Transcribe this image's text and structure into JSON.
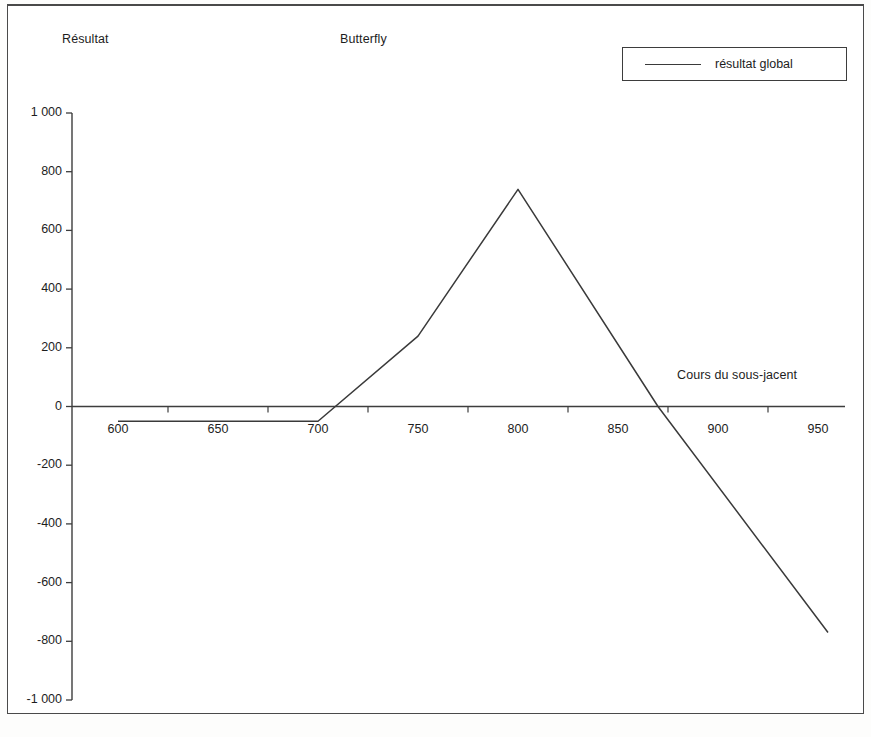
{
  "figure": {
    "y_axis_title": "Résultat",
    "title": "Butterfly",
    "x_axis_title": "Cours du sous-jacent",
    "legend_label": "résultat global",
    "line_color": "#3a3a3a",
    "axis_color": "#3d3d3d",
    "background": "#ffffff"
  },
  "chart_data": {
    "type": "line",
    "title": "Butterfly",
    "xlabel": "Cours du sous-jacent",
    "ylabel": "Résultat",
    "xlim": [
      590,
      960
    ],
    "ylim": [
      -1000,
      1000
    ],
    "grid": false,
    "legend_position": "top-right",
    "x_ticks": [
      600,
      650,
      700,
      750,
      800,
      850,
      900,
      950
    ],
    "x_tick_labels": [
      "600",
      "650",
      "700",
      "750",
      "800",
      "850",
      "900",
      "950"
    ],
    "y_ticks": [
      1000,
      800,
      600,
      400,
      200,
      0,
      -200,
      -400,
      -600,
      -800,
      -1000
    ],
    "y_tick_labels": [
      "1 000",
      "800",
      "600",
      "400",
      "200",
      "0",
      "-200",
      "-400",
      "-600",
      "-800",
      "-1 000"
    ],
    "series": [
      {
        "name": "résultat global",
        "x": [
          600,
          700,
          750,
          800,
          870,
          955
        ],
        "values": [
          -50,
          -50,
          240,
          740,
          0,
          -770
        ]
      }
    ]
  }
}
